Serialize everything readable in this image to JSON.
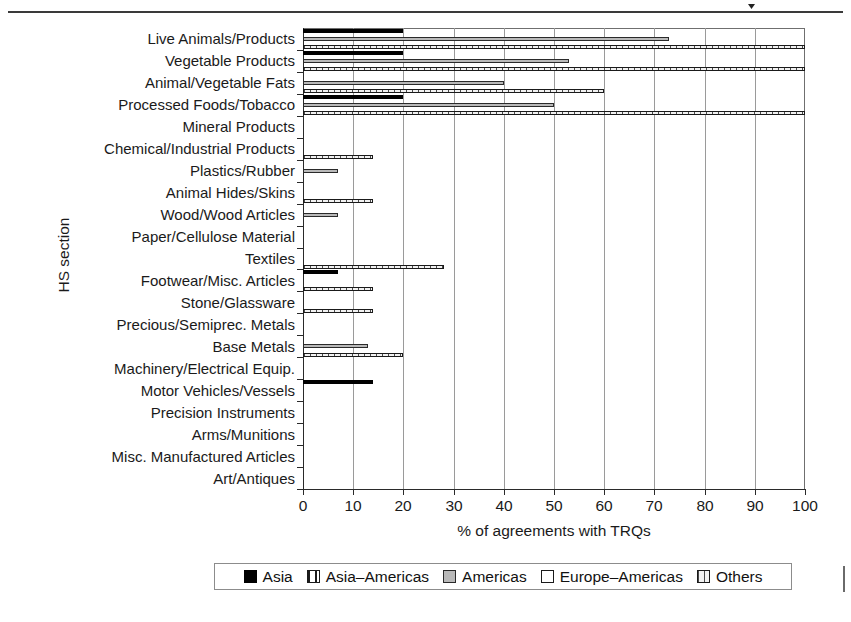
{
  "axis_title_y": "HS section",
  "axis_title_x": "% of agreements with TRQs",
  "legend": {
    "entries": [
      {
        "label": "Asia",
        "key": "asia",
        "swatch": "solid-black-swatch"
      },
      {
        "label": "Asia–Americas",
        "key": "asia_americas",
        "swatch": "vertical-hatch-swatch"
      },
      {
        "label": "Americas",
        "key": "americas",
        "swatch": "solid-gray-swatch"
      },
      {
        "label": "Europe–Americas",
        "key": "europe_americas",
        "swatch": "open-white-swatch"
      },
      {
        "label": "Others",
        "key": "others",
        "swatch": "dotted-white-swatch"
      }
    ]
  },
  "chart_data": {
    "type": "bar",
    "orientation": "horizontal",
    "title": "",
    "xlabel": "% of agreements with TRQs",
    "ylabel": "HS section",
    "xlim": [
      0,
      100
    ],
    "xticks": [
      0,
      10,
      20,
      30,
      40,
      50,
      60,
      70,
      80,
      90,
      100
    ],
    "grid": "vertical",
    "legend_position": "bottom",
    "categories": [
      "Live Animals/Products",
      "Vegetable Products",
      "Animal/Vegetable Fats",
      "Processed Foods/Tobacco",
      "Mineral Products",
      "Chemical/Industrial Products",
      "Plastics/Rubber",
      "Animal Hides/Skins",
      "Wood/Wood Articles",
      "Paper/Cellulose Material",
      "Textiles",
      "Footwear/Misc. Articles",
      "Stone/Glassware",
      "Precious/Semiprec. Metals",
      "Base Metals",
      "Machinery/Electrical Equip.",
      "Motor Vehicles/Vessels",
      "Precision Instruments",
      "Arms/Munitions",
      "Misc. Manufactured Articles",
      "Art/Antiques"
    ],
    "series": [
      {
        "name": "Asia",
        "key": "asia",
        "values": [
          20,
          20,
          0,
          20,
          0,
          0,
          0,
          0,
          0,
          0,
          0,
          7,
          0,
          0,
          0,
          0,
          14,
          0,
          0,
          0,
          0
        ]
      },
      {
        "name": "Asia–Americas",
        "key": "asia_americas",
        "values": [
          57,
          57,
          29,
          57,
          0,
          0,
          0,
          7,
          0,
          0,
          13,
          0,
          7,
          0,
          0,
          0,
          0,
          14,
          0,
          14,
          0
        ]
      },
      {
        "name": "Americas",
        "key": "americas",
        "values": [
          73,
          53,
          40,
          50,
          0,
          0,
          7,
          0,
          7,
          0,
          0,
          0,
          0,
          0,
          13,
          0,
          0,
          0,
          0,
          0,
          0
        ]
      },
      {
        "name": "Europe–Americas",
        "key": "europe_americas",
        "values": [
          100,
          100,
          50,
          60,
          0,
          0,
          0,
          0,
          0,
          0,
          40,
          0,
          0,
          0,
          0,
          0,
          0,
          0,
          0,
          0,
          0
        ]
      },
      {
        "name": "Others",
        "key": "others",
        "values": [
          100,
          100,
          60,
          100,
          0,
          14,
          0,
          14,
          0,
          0,
          28,
          14,
          14,
          0,
          20,
          0,
          0,
          0,
          0,
          0,
          0
        ]
      }
    ]
  }
}
